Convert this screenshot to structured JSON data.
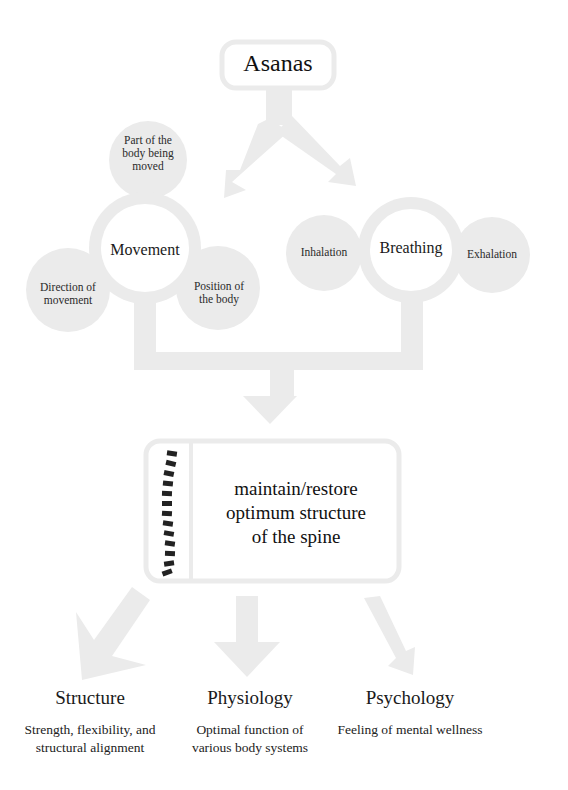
{
  "diagram": {
    "root": {
      "label": "Asanas"
    },
    "components": [
      {
        "label": "Movement",
        "aspects": [
          "Part of the body being moved",
          "Direction of movement",
          "Position of the body"
        ]
      },
      {
        "label": "Breathing",
        "aspects": [
          "Inhalation",
          "Exhalation"
        ]
      }
    ],
    "center": {
      "label_lines": [
        "maintain/restore",
        "optimum structure",
        "of the spine"
      ],
      "icon": "spine-icon",
      "vertebra_count": 13
    },
    "outcomes": [
      {
        "title": "Structure",
        "desc_lines": [
          "Strength, flexibility, and",
          "structural alignment"
        ]
      },
      {
        "title": "Physiology",
        "desc_lines": [
          "Optimal function of",
          "various body systems"
        ]
      },
      {
        "title": "Psychology",
        "desc_lines": [
          "Feeling of mental wellness"
        ]
      }
    ],
    "colors": {
      "shape_fill": "#ebebeb",
      "text": "#1e1e1e",
      "spine": "#222222",
      "background": "#ffffff"
    }
  },
  "labels": {
    "asanas": "Asanas",
    "movement": "Movement",
    "part_line1": "Part of the",
    "part_line2": "body being",
    "part_line3": "moved",
    "direction_line1": "Direction of",
    "direction_line2": "movement",
    "position_line1": "Position of",
    "position_line2": "the body",
    "breathing": "Breathing",
    "inhalation": "Inhalation",
    "exhalation": "Exhalation",
    "center_line1": "maintain/restore",
    "center_line2": "optimum structure",
    "center_line3": "of the spine",
    "structure_title": "Structure",
    "structure_desc1": "Strength, flexibility, and",
    "structure_desc2": "structural alignment",
    "physiology_title": "Physiology",
    "physiology_desc1": "Optimal function of",
    "physiology_desc2": "various body systems",
    "psychology_title": "Psychology",
    "psychology_desc1": "Feeling of mental wellness"
  }
}
